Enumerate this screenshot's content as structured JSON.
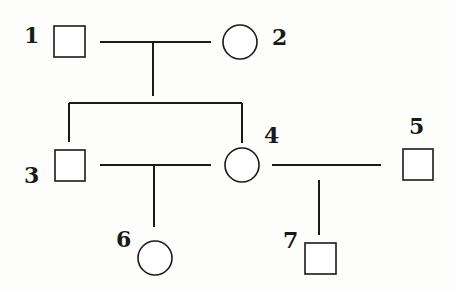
{
  "diagram": {
    "type": "pedigree",
    "individuals": [
      {
        "id": "1",
        "label": "1",
        "sex": "male",
        "shape": "square"
      },
      {
        "id": "2",
        "label": "2",
        "sex": "female",
        "shape": "circle"
      },
      {
        "id": "3",
        "label": "3",
        "sex": "male",
        "shape": "square"
      },
      {
        "id": "4",
        "label": "4",
        "sex": "female",
        "shape": "circle"
      },
      {
        "id": "5",
        "label": "5",
        "sex": "male",
        "shape": "square"
      },
      {
        "id": "6",
        "label": "6",
        "sex": "female",
        "shape": "circle"
      },
      {
        "id": "7",
        "label": "7",
        "sex": "male",
        "shape": "square"
      }
    ],
    "unions": [
      {
        "partners": [
          "1",
          "2"
        ],
        "children": [
          "3",
          "4"
        ]
      },
      {
        "partners": [
          "3",
          "4"
        ],
        "children": [
          "6"
        ]
      },
      {
        "partners": [
          "4",
          "5"
        ],
        "children": [
          "7"
        ]
      }
    ],
    "colors": {
      "stroke": "#1a1a1a",
      "background": "#fdfdfc"
    }
  }
}
